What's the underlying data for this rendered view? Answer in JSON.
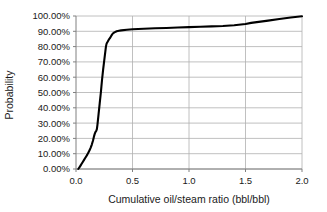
{
  "chart_data": {
    "type": "line",
    "title": "",
    "subtitle": "",
    "xlabel": "Cumulative oil/steam ratio (bbl/bbl)",
    "ylabel": "Probability",
    "xlim": [
      0.0,
      2.0
    ],
    "ylim": [
      0.0,
      1.0
    ],
    "xticks": [
      0.0,
      0.5,
      1.0,
      1.5,
      2.0
    ],
    "xtick_labels": [
      "0.0",
      "0.5",
      "1.0",
      "1.5",
      "2.0"
    ],
    "yticks": [
      0.0,
      0.1,
      0.2,
      0.3,
      0.4,
      0.5,
      0.6,
      0.7,
      0.8,
      0.9,
      1.0
    ],
    "ytick_labels": [
      "0.00%",
      "10.00%",
      "20.00%",
      "30.00%",
      "40.00%",
      "50.00%",
      "60.00%",
      "70.00%",
      "80.00%",
      "90.00%",
      "100.00%"
    ],
    "grid": "horizontal-and-vertical",
    "legend": "none",
    "line_color": "#000000",
    "grid_color": "#b0b0b0",
    "axis_color": "#808080",
    "series": [
      {
        "name": "Cumulative distribution",
        "x": [
          0.02,
          0.03,
          0.04,
          0.05,
          0.06,
          0.07,
          0.08,
          0.09,
          0.1,
          0.11,
          0.12,
          0.13,
          0.14,
          0.15,
          0.155,
          0.16,
          0.165,
          0.17,
          0.175,
          0.18,
          0.185,
          0.19,
          0.2,
          0.21,
          0.22,
          0.225,
          0.23,
          0.24,
          0.25,
          0.26,
          0.265,
          0.27,
          0.275,
          0.28,
          0.29,
          0.3,
          0.31,
          0.32,
          0.33,
          0.34,
          0.36,
          0.38,
          0.4,
          0.45,
          0.5,
          0.6,
          0.7,
          0.8,
          0.9,
          1.0,
          1.1,
          1.2,
          1.3,
          1.4,
          1.5,
          1.55,
          1.6,
          1.7,
          1.8,
          1.9,
          2.0
        ],
        "y": [
          0.0,
          0.01,
          0.022,
          0.034,
          0.046,
          0.058,
          0.07,
          0.082,
          0.094,
          0.108,
          0.122,
          0.14,
          0.16,
          0.185,
          0.2,
          0.215,
          0.228,
          0.238,
          0.245,
          0.25,
          0.262,
          0.29,
          0.36,
          0.43,
          0.5,
          0.54,
          0.58,
          0.65,
          0.71,
          0.77,
          0.8,
          0.818,
          0.826,
          0.832,
          0.845,
          0.855,
          0.868,
          0.88,
          0.888,
          0.893,
          0.9,
          0.903,
          0.906,
          0.91,
          0.913,
          0.917,
          0.92,
          0.922,
          0.925,
          0.927,
          0.93,
          0.932,
          0.935,
          0.94,
          0.948,
          0.955,
          0.96,
          0.97,
          0.98,
          0.99,
          0.998
        ]
      }
    ]
  }
}
